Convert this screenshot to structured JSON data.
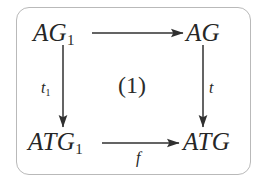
{
  "figure": {
    "kind": "commutative-diagram",
    "frame": {
      "shape": "rounded-rectangle",
      "border_color": "#b9b9b9",
      "background_color": "#ffffff"
    },
    "ink_color": "#262626",
    "nodes": {
      "top_left": {
        "base": "AG",
        "sub": "1"
      },
      "top_right": {
        "base": "AG",
        "sub": ""
      },
      "bottom_left": {
        "base": "ATG",
        "sub": "1"
      },
      "bottom_right": {
        "base": "ATG",
        "sub": ""
      }
    },
    "edges": {
      "top": {
        "label": "",
        "sub": "",
        "direction": "right"
      },
      "left": {
        "label": "t",
        "sub": "1",
        "direction": "down"
      },
      "right": {
        "label": "t",
        "sub": "",
        "direction": "down"
      },
      "bottom": {
        "label": "f",
        "sub": "",
        "direction": "right"
      }
    },
    "region_label": "(1)"
  }
}
